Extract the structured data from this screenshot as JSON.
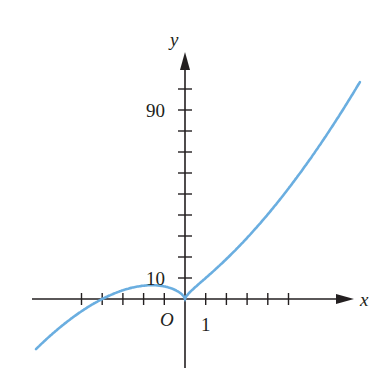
{
  "chart_data": {
    "type": "line",
    "title": "",
    "xlabel": "x",
    "ylabel": "y",
    "origin_label": "O",
    "tick_labels": {
      "x": [
        "1"
      ],
      "y": [
        "10",
        "90"
      ]
    },
    "x_ticks": [
      -5,
      -4,
      -3,
      -2,
      -1,
      1,
      2,
      3,
      4,
      5
    ],
    "y_ticks": [
      10,
      20,
      30,
      40,
      50,
      60,
      70,
      80,
      90,
      100
    ],
    "xlim": [
      -7.4,
      8.5
    ],
    "ylim": [
      -30,
      110
    ],
    "grid": false,
    "curve_color": "#6aaee0",
    "series": [
      {
        "name": "f(x)",
        "x": [
          -7.2,
          -6,
          -5,
          -4,
          -3,
          -2,
          -1.6,
          -1,
          -0.5,
          0,
          0.5,
          1,
          2,
          3,
          4,
          5,
          6,
          7,
          8.3
        ],
        "y": [
          -23.9,
          -13.2,
          -5.8,
          0,
          4.2,
          6.3,
          6.6,
          6,
          4.4,
          0,
          5.7,
          10,
          19,
          29,
          40,
          53,
          66,
          80,
          101
        ]
      }
    ],
    "curve_notes": "Cusp at origin, local max near x=-1.6, crosses x-axis at x=-4"
  }
}
